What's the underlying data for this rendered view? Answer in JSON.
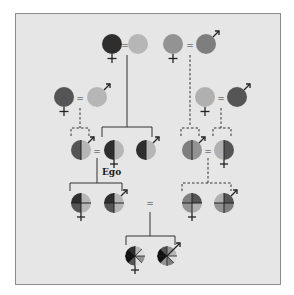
{
  "diagram": {
    "type": "kinship-inheritance-chart",
    "ego_label": "Ego",
    "colors": {
      "frame_bg": "#e6e6e6",
      "frame_border": "#8c8c8c",
      "black": "#2e2e2e",
      "dark": "#555555",
      "medium": "#7e7e7e",
      "medium_light": "#939393",
      "light": "#b6b6b6",
      "line": "#333333"
    },
    "generations": [
      {
        "label": "great-grandparents",
        "couples": [
          {
            "wife": {
              "sex": "female",
              "color": "black"
            },
            "husband": {
              "sex": "unmarked",
              "color": "light"
            },
            "descent": "solid"
          },
          {
            "wife": {
              "sex": "female",
              "color": "medium_light"
            },
            "husband": {
              "sex": "male",
              "color": "medium"
            },
            "descent": "dashed"
          }
        ]
      },
      {
        "label": "grandparents (outer)",
        "couples": [
          {
            "wife": {
              "sex": "female",
              "color": "dark"
            },
            "husband": {
              "sex": "male",
              "color": "light"
            },
            "descent": "dashed"
          },
          {
            "wife": {
              "sex": "female",
              "color": "light"
            },
            "husband": {
              "sex": "male",
              "color": "dark"
            },
            "descent": "dashed"
          }
        ]
      },
      {
        "label": "parents generation (half shading)",
        "individuals": [
          "male (dark|light)",
          "Ego female (black|light)",
          "male (black|light)",
          "male (medium|medium_light)",
          "female (light|dark)"
        ]
      },
      {
        "label": "children generation (quarter shading)",
        "individuals": [
          "female",
          "male",
          "female",
          "male"
        ]
      },
      {
        "label": "grandchildren (eighth shading)",
        "individuals": [
          "female",
          "male"
        ]
      }
    ],
    "symbols": {
      "equals": "=",
      "female_cross": "+",
      "male_arrow": "↗"
    }
  }
}
